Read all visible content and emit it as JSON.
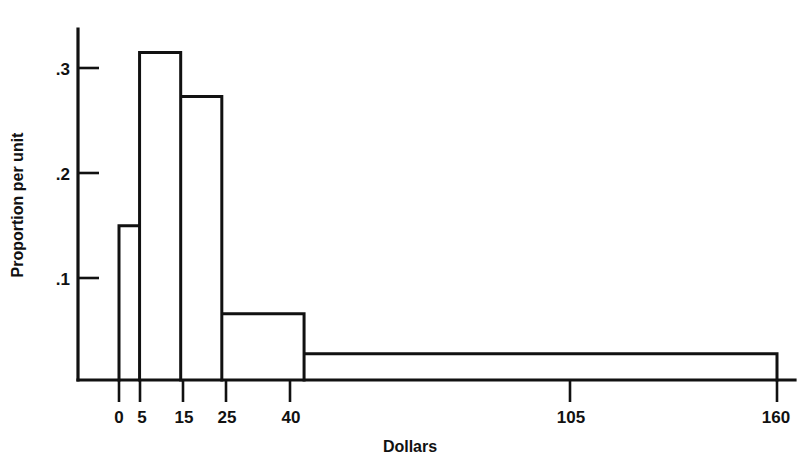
{
  "chart_data": {
    "type": "bar",
    "title": "",
    "subtitle": "",
    "xlabel": "Dollars",
    "ylabel": "Proportion per unit",
    "grid": false,
    "legend": "none",
    "orientation": "vertical",
    "note": "Histogram with unequal class intervals; bar heights are density (proportion per unit of Dollars).",
    "xlim": [
      0,
      160
    ],
    "ylim": [
      0,
      0.34
    ],
    "x_tick_labels": [
      "0",
      "5",
      "15",
      "25",
      "40",
      "105",
      "160"
    ],
    "x_tick_values": [
      0,
      5,
      15,
      25,
      40,
      105,
      160
    ],
    "y_tick_labels": [
      ".1",
      ".2",
      ".3"
    ],
    "y_tick_values": [
      0.1,
      0.2,
      0.3
    ],
    "bin_edges": [
      0,
      5,
      15,
      25,
      45,
      160
    ],
    "categories": [
      "0-5",
      "5-15",
      "15-25",
      "25-45",
      "45-160"
    ],
    "values": [
      0.147,
      0.312,
      0.27,
      0.063,
      0.025
    ],
    "bars": [
      {
        "label": "0-5",
        "x0": 0,
        "x1": 5,
        "height": 0.147
      },
      {
        "label": "5-15",
        "x0": 5,
        "x1": 15,
        "height": 0.312
      },
      {
        "label": "15-25",
        "x0": 15,
        "x1": 25,
        "height": 0.27
      },
      {
        "label": "25-45",
        "x0": 25,
        "x1": 45,
        "height": 0.063
      },
      {
        "label": "45-160",
        "x0": 45,
        "x1": 160,
        "height": 0.025
      }
    ],
    "colors": {
      "ink": "#111111",
      "background": "#ffffff",
      "bar_fill": "none",
      "bar_stroke": "#111111"
    }
  }
}
